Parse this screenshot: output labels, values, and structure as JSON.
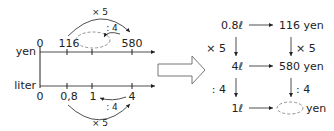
{
  "number_line": {
    "top_axis_label": "yen",
    "bottom_axis_label": "liter",
    "top_ticks": [
      "0",
      "116",
      "",
      "580"
    ],
    "bottom_ticks": [
      "0",
      "0,8",
      "1",
      "4"
    ],
    "top_arc_label": "× 5",
    "top_inner_arc_label": ": 4",
    "bottom_arc_label": "× 5",
    "bottom_inner_arc_label": ": 4",
    "unknown": ""
  },
  "arrow": {
    "name": "implies-arrow"
  },
  "table": {
    "row1_left": "0.8ℓ",
    "row1_right": "116 yen",
    "row2_left": "4ℓ",
    "row2_right": "580 yen",
    "row3_left": "1ℓ",
    "row3_right_unit": "yen",
    "op1_left": "× 5",
    "op1_right": "× 5",
    "op2_left": ": 4",
    "op2_right": ": 4"
  },
  "colors": {
    "ink": "#222222",
    "dashed": "#888888"
  }
}
